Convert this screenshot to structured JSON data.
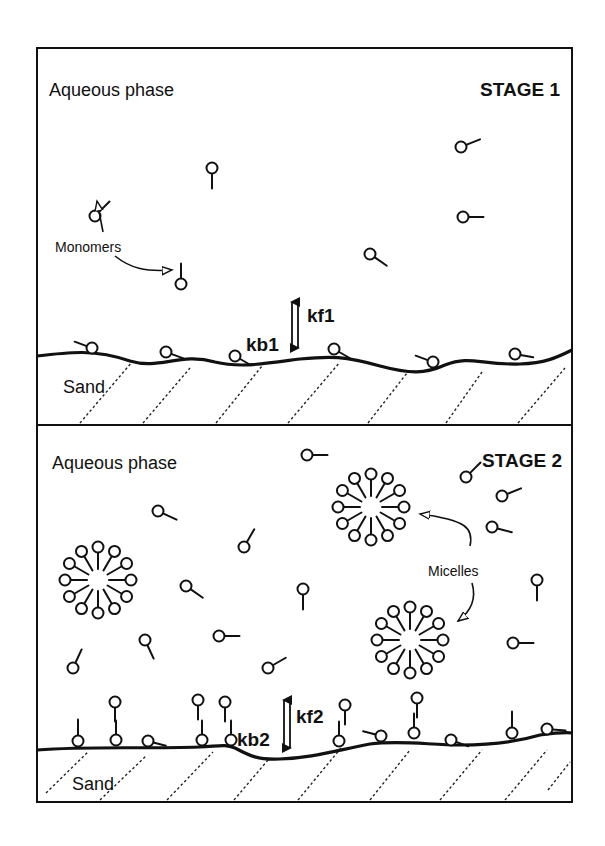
{
  "figure": {
    "colors": {
      "ink": "#111111",
      "background": "#ffffff"
    }
  },
  "stage1": {
    "stage_label": "STAGE 1",
    "phase_label": "Aqueous phase",
    "substrate_label": "Sand",
    "annotation_label": "Monomers",
    "forward_rate": "kf1",
    "backward_rate": "kb1",
    "free_monomers": [
      {
        "x": 212,
        "y": 168,
        "angle": 90
      },
      {
        "x": 95,
        "y": 216,
        "angle": -45
      },
      {
        "x": 461,
        "y": 147,
        "angle": -22
      },
      {
        "x": 463,
        "y": 217,
        "angle": 0
      },
      {
        "x": 370,
        "y": 254,
        "angle": 35
      },
      {
        "x": 181,
        "y": 284,
        "angle": -90
      }
    ],
    "adsorbed_monomers": [
      {
        "x": 92,
        "y": 348,
        "angle": 200
      },
      {
        "x": 166,
        "y": 352,
        "angle": 20
      },
      {
        "x": 235,
        "y": 356,
        "angle": 30
      },
      {
        "x": 334,
        "y": 349,
        "angle": 30
      },
      {
        "x": 433,
        "y": 362,
        "angle": 200
      },
      {
        "x": 515,
        "y": 354,
        "angle": 10
      }
    ]
  },
  "stage2": {
    "stage_label": "STAGE 2",
    "phase_label": "Aqueous phase",
    "substrate_label": "Sand",
    "annotation_label": "Micelles",
    "forward_rate": "kf2",
    "backward_rate": "kb2",
    "micelles": [
      {
        "cx": 98,
        "cy": 580
      },
      {
        "cx": 371,
        "cy": 507
      },
      {
        "cx": 410,
        "cy": 640
      }
    ],
    "free_monomers": [
      {
        "x": 307,
        "y": 455,
        "angle": 0
      },
      {
        "x": 466,
        "y": 477,
        "angle": -45
      },
      {
        "x": 158,
        "y": 511,
        "angle": 25
      },
      {
        "x": 502,
        "y": 496,
        "angle": -22
      },
      {
        "x": 492,
        "y": 527,
        "angle": 15
      },
      {
        "x": 244,
        "y": 547,
        "angle": -60
      },
      {
        "x": 186,
        "y": 586,
        "angle": 35
      },
      {
        "x": 303,
        "y": 589,
        "angle": 90
      },
      {
        "x": 537,
        "y": 580,
        "angle": 90
      },
      {
        "x": 145,
        "y": 640,
        "angle": 65
      },
      {
        "x": 219,
        "y": 636,
        "angle": 0
      },
      {
        "x": 513,
        "y": 643,
        "angle": 0
      },
      {
        "x": 73,
        "y": 668,
        "angle": -65
      },
      {
        "x": 268,
        "y": 668,
        "angle": -30
      }
    ],
    "bilayer_pairs": [
      {
        "x": 115,
        "y": 702,
        "bx": 116,
        "by": 740
      },
      {
        "x": 198,
        "y": 700,
        "bx": 202,
        "by": 740
      },
      {
        "x": 225,
        "y": 702,
        "bx": 231,
        "by": 740
      },
      {
        "x": 345,
        "y": 705,
        "bx": 339,
        "by": 741
      },
      {
        "x": 417,
        "y": 698,
        "bx": 414,
        "by": 733
      }
    ],
    "adsorbed_tail_up": [
      {
        "x": 78,
        "y": 741
      },
      {
        "x": 512,
        "y": 733
      }
    ],
    "adsorbed_flat": [
      {
        "x": 148,
        "y": 741,
        "angle": 15
      },
      {
        "x": 381,
        "y": 736,
        "angle": 195
      },
      {
        "x": 451,
        "y": 740,
        "angle": 20
      },
      {
        "x": 547,
        "y": 729,
        "angle": 5
      }
    ]
  }
}
